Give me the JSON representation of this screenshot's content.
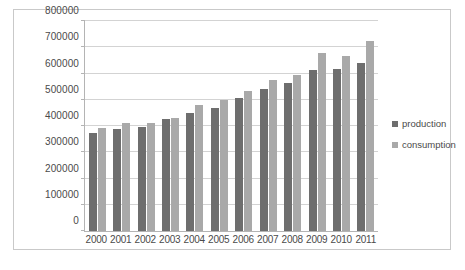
{
  "chart_data": {
    "type": "bar",
    "title": "",
    "xlabel": "",
    "ylabel": "",
    "categories": [
      "2000",
      "2001",
      "2002",
      "2003",
      "2004",
      "2005",
      "2006",
      "2007",
      "2008",
      "2009",
      "2010",
      "2011"
    ],
    "series": [
      {
        "name": "production",
        "color": "#6e6e6e",
        "values": [
          375000,
          390000,
          395000,
          425000,
          450000,
          470000,
          505000,
          540000,
          565000,
          615000,
          617000,
          640000
        ]
      },
      {
        "name": "consumption",
        "color": "#a9a9a9",
        "values": [
          393000,
          410000,
          412000,
          432000,
          480000,
          500000,
          535000,
          575000,
          595000,
          680000,
          665000,
          725000
        ]
      }
    ],
    "ylim": [
      0,
      800000
    ],
    "ytick_values": [
      0,
      100000,
      200000,
      300000,
      400000,
      500000,
      600000,
      700000,
      800000
    ],
    "ytick_labels": [
      "0",
      "100000",
      "200000",
      "300000",
      "400000",
      "500000",
      "600000",
      "700000",
      "800000"
    ],
    "grid": true,
    "grid_axis": "y",
    "legend_position": "right",
    "legend_entries": [
      "production",
      "consumption"
    ]
  }
}
